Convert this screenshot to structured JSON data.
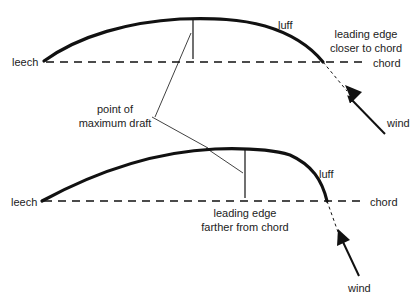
{
  "diagram": {
    "top_sail": {
      "leech_label": "leech",
      "luff_label": "luff",
      "leading_edge_label_line1": "leading edge",
      "leading_edge_label_line2": "closer to chord",
      "chord_label": "chord",
      "wind_label": "wind"
    },
    "shared": {
      "draft_label_line1": "point of",
      "draft_label_line2": "maximum draft"
    },
    "bottom_sail": {
      "leech_label": "leech",
      "luff_label": "luff",
      "leading_edge_label_line1": "leading edge",
      "leading_edge_label_line2": "farther from chord",
      "chord_label": "chord",
      "wind_label": "wind"
    },
    "colors": {
      "line": "#111111",
      "background": "#ffffff"
    }
  }
}
